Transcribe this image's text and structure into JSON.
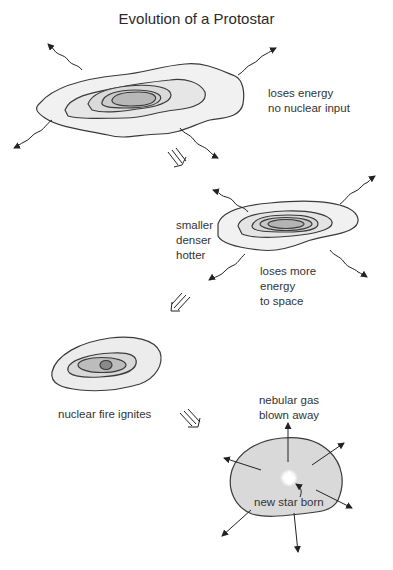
{
  "diagram": {
    "title": "Evolution of a Protostar",
    "stages": [
      {
        "id": "stage-1",
        "label": "loses energy\nno nuclear input"
      },
      {
        "id": "stage-2",
        "label_left": "smaller\ndenser\nhotter",
        "label_below": "loses more\nenergy\nto space"
      },
      {
        "id": "stage-3",
        "label": "nuclear fire ignites"
      },
      {
        "id": "stage-4",
        "label_top": "nebular gas\nblown away",
        "label_center": "new star born"
      }
    ],
    "colors": {
      "outline": "#3a3a3a",
      "fill_outer": "#f1f1f1",
      "fill_2": "#e4e4e4",
      "fill_3": "#d6d6d6",
      "fill_4": "#c6c6c6",
      "fill_core": "#a9a9a9",
      "star_glow": "#ffffff"
    }
  }
}
